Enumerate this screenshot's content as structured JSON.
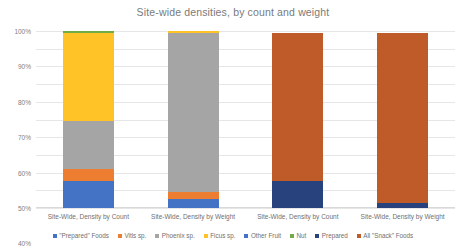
{
  "chart_data": {
    "type": "bar",
    "title": "Site-wide densities, by count and weight",
    "xlabel": "",
    "ylabel": "",
    "ylim": [
      0,
      100
    ],
    "ytick_labels": [
      "100%",
      "90%",
      "80%",
      "70%",
      "60%",
      "50%",
      "40%",
      "30%",
      "20%",
      "10%",
      "0%"
    ],
    "ytick_values": [
      100,
      90,
      80,
      70,
      60,
      50,
      40,
      30,
      20,
      10,
      0
    ],
    "grid": true,
    "stacked": true,
    "legend_position": "bottom",
    "categories": [
      "Site-Wide, Density by Count",
      "Site-Wide, Density by Weight",
      "Site-Wide, Density by Count",
      "Site-Wide, Density by Weight"
    ],
    "series": [
      {
        "name": "\"Prepared\" Foods",
        "color": "#4472c4",
        "values": [
          15,
          5,
          0,
          0
        ]
      },
      {
        "name": "Vitis sp.",
        "color": "#ed7d31",
        "values": [
          7,
          4,
          0,
          0
        ]
      },
      {
        "name": "Phoenix sp.",
        "color": "#a5a5a5",
        "values": [
          27,
          90,
          0,
          0
        ]
      },
      {
        "name": "Ficus sp.",
        "color": "#ffc328",
        "values": [
          50,
          1,
          0,
          0
        ]
      },
      {
        "name": "Other Fruit",
        "color": "#4472c4",
        "values": [
          0,
          0,
          0,
          0
        ]
      },
      {
        "name": "Nut",
        "color": "#70ad47",
        "values": [
          1,
          0,
          0,
          0
        ]
      },
      {
        "name": "Prepared",
        "color": "#28427e",
        "values": [
          0,
          0,
          15,
          3
        ]
      },
      {
        "name": "All \"Snack\" Foods",
        "color": "#bf5b28",
        "values": [
          0,
          0,
          84,
          96
        ]
      }
    ]
  }
}
